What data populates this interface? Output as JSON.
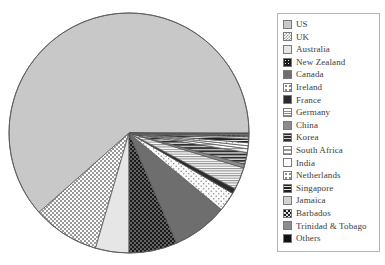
{
  "chart_data": {
    "type": "pie",
    "title": "",
    "subtitle": "",
    "xlabel": "",
    "ylabel": "",
    "legend_position": "right",
    "grid": false,
    "start_angle_deg": 0,
    "direction": "counterclockwise",
    "categories": [
      "US",
      "UK",
      "Australia",
      "New Zealand",
      "Canada",
      "Ireland",
      "France",
      "Germany",
      "China",
      "Korea",
      "South Africa",
      "India",
      "Netherlands",
      "Singapore",
      "Jamaica",
      "Barbados",
      "Trinidad & Tobago",
      "Others"
    ],
    "values": [
      61.5,
      9.0,
      4.5,
      6.5,
      7.5,
      2.6,
      0.7,
      3.0,
      0.5,
      1.6,
      0.5,
      0.4,
      0.4,
      0.5,
      0.3,
      0.2,
      0.2,
      0.1
    ],
    "unit": "percent",
    "slices": [
      {
        "label": "US",
        "value": 61.5,
        "fill": "#c8c8c8",
        "pattern": "solid",
        "stroke": "#5a5a5a"
      },
      {
        "label": "UK",
        "value": 9.0,
        "fill": "#ffffff",
        "pattern": "checker",
        "stroke": "#5a5a5a"
      },
      {
        "label": "Australia",
        "value": 4.5,
        "fill": "#e6e6e6",
        "pattern": "solid",
        "stroke": "#5a5a5a"
      },
      {
        "label": "New Zealand",
        "value": 6.5,
        "fill": "#1a1a1a",
        "pattern": "dots-light",
        "stroke": "#5a5a5a"
      },
      {
        "label": "Canada",
        "value": 7.5,
        "fill": "#6e6e6e",
        "pattern": "solid",
        "stroke": "#5a5a5a"
      },
      {
        "label": "Ireland",
        "value": 2.6,
        "fill": "#fafafa",
        "pattern": "dots-dark",
        "stroke": "#5a5a5a"
      },
      {
        "label": "France",
        "value": 0.7,
        "fill": "#2b2b2b",
        "pattern": "solid",
        "stroke": "#5a5a5a"
      },
      {
        "label": "Germany",
        "value": 3.0,
        "fill": "#ffffff",
        "pattern": "hlines-fine",
        "stroke": "#5a5a5a"
      },
      {
        "label": "China",
        "value": 0.5,
        "fill": "#8c8c8c",
        "pattern": "solid",
        "stroke": "#5a5a5a"
      },
      {
        "label": "Korea",
        "value": 1.6,
        "fill": "#3d3d3d",
        "pattern": "hlines-bold",
        "stroke": "#5a5a5a"
      },
      {
        "label": "South Africa",
        "value": 0.5,
        "fill": "#ffffff",
        "pattern": "hlines-wide",
        "stroke": "#5a5a5a"
      },
      {
        "label": "India",
        "value": 0.4,
        "fill": "#ffffff",
        "pattern": "solid",
        "stroke": "#5a5a5a"
      },
      {
        "label": "Netherlands",
        "value": 0.4,
        "fill": "#ffffff",
        "pattern": "dots-sparse",
        "stroke": "#5a5a5a"
      },
      {
        "label": "Singapore",
        "value": 0.5,
        "fill": "#2b2b2b",
        "pattern": "hlines-heavy",
        "stroke": "#5a5a5a"
      },
      {
        "label": "Jamaica",
        "value": 0.3,
        "fill": "#d2d2d2",
        "pattern": "solid",
        "stroke": "#5a5a5a"
      },
      {
        "label": "Barbados",
        "value": 0.2,
        "fill": "#1a1a1a",
        "pattern": "blocks",
        "stroke": "#5a5a5a"
      },
      {
        "label": "Trinidad & Tobago",
        "value": 0.2,
        "fill": "#8c8c8c",
        "pattern": "solid",
        "stroke": "#5a5a5a"
      },
      {
        "label": "Others",
        "value": 0.1,
        "fill": "#111111",
        "pattern": "solid",
        "stroke": "#5a5a5a"
      }
    ]
  },
  "legend": {
    "items": [
      {
        "label": "US"
      },
      {
        "label": "UK"
      },
      {
        "label": "Australia"
      },
      {
        "label": "New Zealand"
      },
      {
        "label": "Canada"
      },
      {
        "label": "Ireland"
      },
      {
        "label": "France"
      },
      {
        "label": "Germany"
      },
      {
        "label": "China"
      },
      {
        "label": "Korea"
      },
      {
        "label": "South Africa"
      },
      {
        "label": "India"
      },
      {
        "label": "Netherlands"
      },
      {
        "label": "Singapore"
      },
      {
        "label": "Jamaica"
      },
      {
        "label": "Barbados"
      },
      {
        "label": "Trinidad & Tobago"
      },
      {
        "label": "Others"
      }
    ]
  },
  "geometry": {
    "center_x": 129,
    "center_y": 133,
    "radius": 120
  },
  "colors": {
    "background": "#ffffff",
    "outline": "#5a5a5a",
    "legend_border": "#b4b4b4",
    "text": "#3b3b3b"
  }
}
